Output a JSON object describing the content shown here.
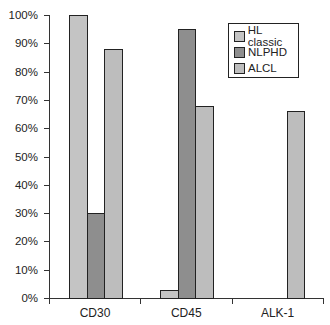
{
  "chart_data": {
    "type": "bar",
    "title": "",
    "xlabel": "",
    "ylabel": "",
    "ylim": [
      0,
      100
    ],
    "y_tick_labels": [
      "0%",
      "10%",
      "20%",
      "30%",
      "40%",
      "50%",
      "60%",
      "70%",
      "80%",
      "90%",
      "100%"
    ],
    "categories": [
      "CD30",
      "CD45",
      "ALK-1"
    ],
    "series": [
      {
        "name": "HL classic",
        "color": "#c4c4c4",
        "values": [
          100,
          3,
          0
        ]
      },
      {
        "name": "NLPHD",
        "color": "#8e8e8e",
        "values": [
          30,
          95,
          0
        ]
      },
      {
        "name": "ALCL",
        "color": "#bdbdbd",
        "values": [
          88,
          68,
          66
        ]
      }
    ],
    "grid": false,
    "legend_position": "upper right (inside)"
  }
}
